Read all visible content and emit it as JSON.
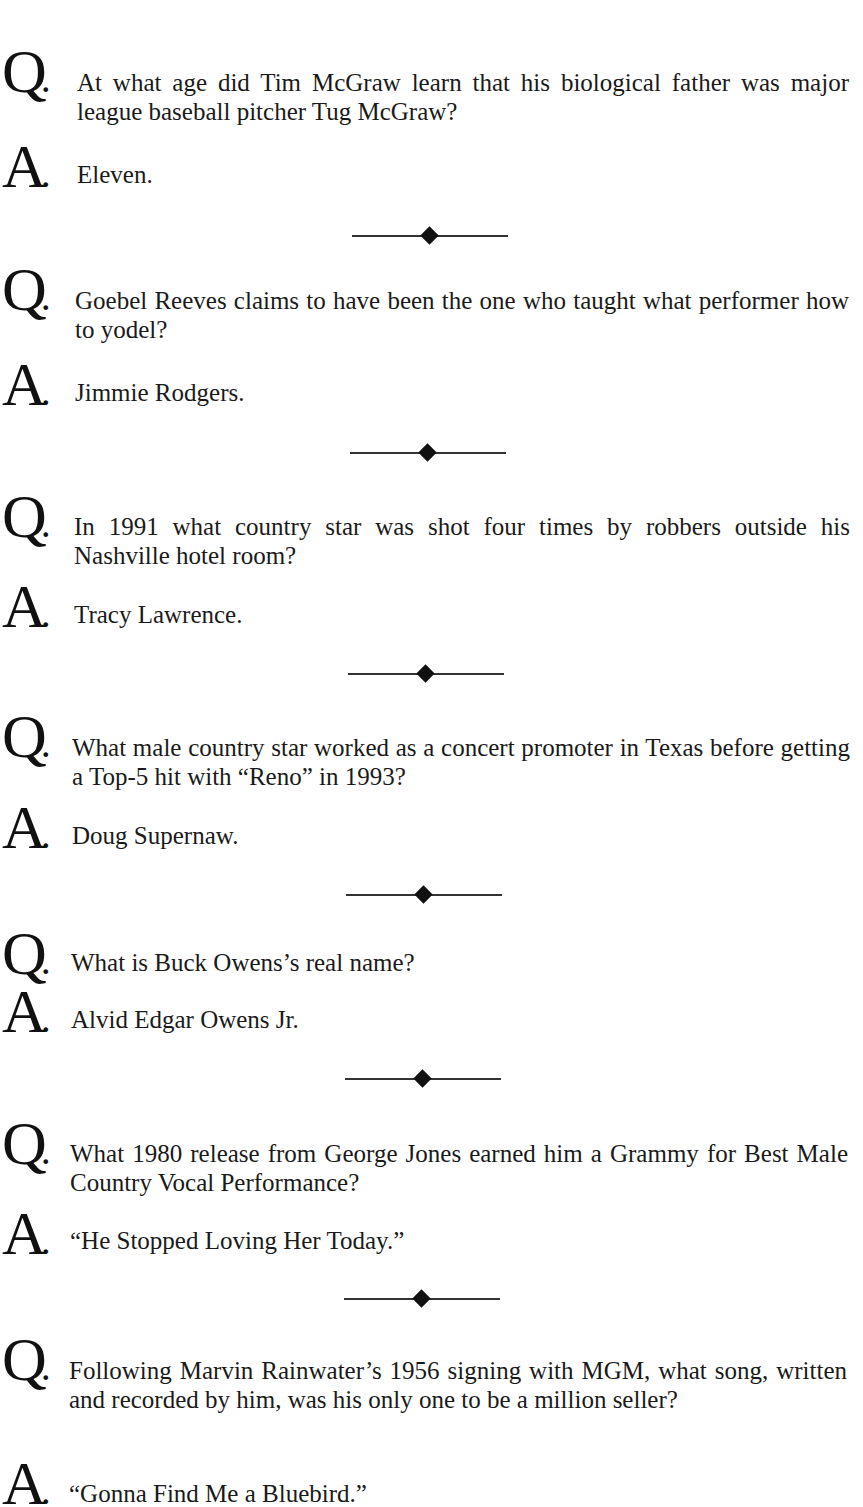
{
  "page": {
    "items": [
      {
        "q_marker": "Q",
        "question": "At what age did Tim McGraw learn that his biological father was major league baseball pitcher Tug McGraw?",
        "a_marker": "A",
        "answer": "Eleven."
      },
      {
        "q_marker": "Q",
        "question": "Goebel Reeves claims to have been the one who taught what performer how to yodel?",
        "a_marker": "A",
        "answer": "Jimmie Rodgers."
      },
      {
        "q_marker": "Q",
        "question": "In 1991 what country star was shot four times by robbers outside his Nashville hotel room?",
        "a_marker": "A",
        "answer": "Tracy Lawrence."
      },
      {
        "q_marker": "Q",
        "question": "What male country star worked as a concert promoter in Texas before getting a Top-5 hit with “Reno” in 1993?",
        "a_marker": "A",
        "answer": "Doug Supernaw."
      },
      {
        "q_marker": "Q",
        "question": "What is Buck Owens’s real name?",
        "a_marker": "A",
        "answer": "Alvid Edgar Owens Jr."
      },
      {
        "q_marker": "Q",
        "question": "What 1980 release from George Jones earned him a Grammy for Best Male Country Vocal Performance?",
        "a_marker": "A",
        "answer": "“He Stopped Loving Her Today.”"
      },
      {
        "q_marker": "Q",
        "question": "Following Marvin Rainwater’s 1956 signing with MGM, what song, written and recorded by him, was his only one to be a million seller?",
        "a_marker": "A",
        "answer": "“Gonna Find Me a Bluebird.”"
      }
    ],
    "marker_dot": "."
  }
}
